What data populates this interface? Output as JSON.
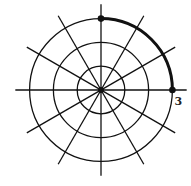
{
  "diagram": {
    "type": "polar-grid",
    "center": [
      101,
      90
    ],
    "scale_px_per_unit": 23.8,
    "circles": [
      1,
      2,
      3
    ],
    "ray_angles_deg": [
      0,
      30,
      60,
      90,
      120,
      150
    ],
    "ray_extent_units": 3.6,
    "highlight_arc": {
      "r": 3,
      "from_deg": 0,
      "to_deg": 90
    },
    "points": [
      {
        "r": 3,
        "theta_deg": 90
      },
      {
        "r": 3,
        "theta_deg": 0
      }
    ],
    "labels": [
      {
        "text": "3",
        "at_r": 3.2,
        "theta_deg": -8
      }
    ],
    "colors": {
      "line": "#111111",
      "background": "#ffffff"
    }
  }
}
